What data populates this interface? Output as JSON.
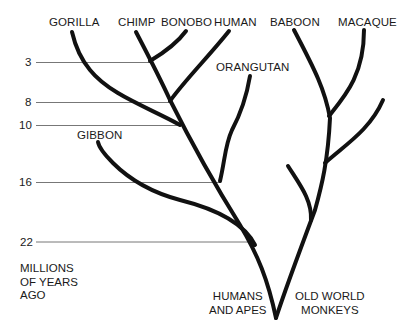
{
  "diagram": {
    "type": "phylogenetic-tree",
    "colors": {
      "branch": "#111111",
      "guide_line": "#777777",
      "text": "#1a1a1a",
      "background": "#ffffff"
    },
    "species": [
      {
        "label": "GORILLA"
      },
      {
        "label": "CHIMP"
      },
      {
        "label": "BONOBO"
      },
      {
        "label": "HUMAN"
      },
      {
        "label": "BABOON"
      },
      {
        "label": "MACAQUE"
      },
      {
        "label": "ORANGUTAN"
      },
      {
        "label": "GIBBON"
      }
    ],
    "time_axis": {
      "ticks": [
        {
          "label": "3"
        },
        {
          "label": "8"
        },
        {
          "label": "10"
        },
        {
          "label": "16"
        },
        {
          "label": "22"
        }
      ],
      "title_lines": [
        "MILLIONS",
        "OF YEARS",
        "AGO"
      ]
    },
    "groups": [
      {
        "lines": [
          "HUMANS",
          "AND APES"
        ]
      },
      {
        "lines": [
          "OLD WORLD",
          "MONKEYS"
        ]
      }
    ]
  }
}
